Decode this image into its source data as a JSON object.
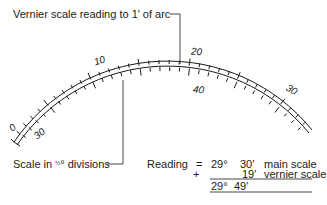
{
  "diagram": {
    "type": "vernier-scale-illustration",
    "colors": {
      "ink": "#1a1a1a",
      "background": "#ffffff"
    },
    "labels": {
      "top_callout": "Vernier scale reading to 1′ of arc",
      "bottom_callout_prefix": "Scale in ",
      "bottom_callout_fraction": "½",
      "bottom_callout_suffix": "° divisions"
    },
    "main_scale": {
      "tick_labels": [
        "0",
        "10",
        "20",
        "30"
      ]
    },
    "vernier_scale": {
      "tick_labels": [
        "30",
        "40"
      ]
    },
    "reading": {
      "label": "Reading",
      "equals": "=",
      "plus": "+",
      "line1": {
        "deg": "29°",
        "min": "30′",
        "desc": "main scale"
      },
      "line2": {
        "min": "19′",
        "desc": "vernier scale"
      },
      "total": {
        "deg": "29°",
        "min": "49′"
      }
    }
  }
}
